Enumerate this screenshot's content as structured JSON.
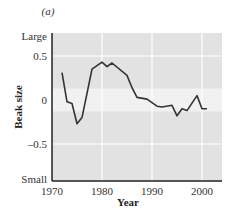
{
  "panel_label": "(a)",
  "chart_data": {
    "type": "line",
    "title": "",
    "panel": "(a)",
    "xlabel": "Year",
    "ylabel": "Beak size",
    "xlim": [
      1970,
      2004
    ],
    "ylim": [
      -0.75,
      0.75
    ],
    "x_ticks": [
      1970,
      1980,
      1990,
      2000
    ],
    "x_tick_labels": [
      "1970",
      "1980",
      "1990",
      "2000"
    ],
    "y_ticks": [
      0.75,
      0.5,
      0,
      -0.5,
      -0.75
    ],
    "y_tick_labels": [
      "Large",
      "0.5",
      "0",
      "–0.5",
      "Small"
    ],
    "grid": true,
    "legend": null,
    "highlight_band": [
      -0.13,
      0.13
    ],
    "series": [
      {
        "name": "Beak size",
        "x": [
          1972,
          1973,
          1974,
          1975,
          1976,
          1978,
          1980,
          1981,
          1982,
          1985,
          1986,
          1987,
          1989,
          1990,
          1991,
          1992,
          1994,
          1995,
          1996,
          1997,
          1999,
          2000,
          2001
        ],
        "values": [
          0.31,
          -0.02,
          -0.04,
          -0.27,
          -0.2,
          0.35,
          0.43,
          0.38,
          0.42,
          0.28,
          0.14,
          0.03,
          0.01,
          -0.03,
          -0.07,
          -0.08,
          -0.06,
          -0.18,
          -0.1,
          -0.12,
          0.05,
          -0.1,
          -0.1
        ]
      }
    ]
  },
  "colors": {
    "plot_bg": "#e2e2e2",
    "band_bg": "#f1f1f1",
    "grid": "#ffffff",
    "line": "#333333",
    "axis": "#222222"
  }
}
